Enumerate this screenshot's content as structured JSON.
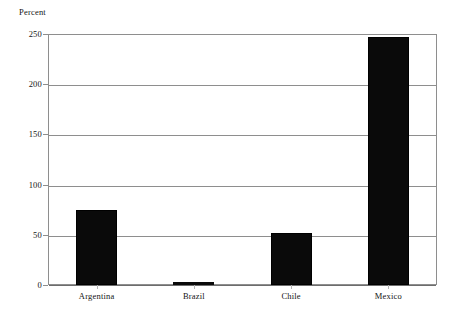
{
  "chart_data": {
    "type": "bar",
    "title": "",
    "subtitle": "",
    "xlabel": "",
    "ylabel": "Percent",
    "categories": [
      "Argentina",
      "Brazil",
      "Chile",
      "Mexico"
    ],
    "values": [
      75,
      2,
      52,
      247
    ],
    "ylim": [
      0,
      250
    ],
    "yticks": [
      0,
      50,
      100,
      150,
      200,
      250
    ],
    "ytick_labels": [
      "0",
      "50",
      "100",
      "150",
      "200",
      "250"
    ],
    "grid": true,
    "grid_axis": "y",
    "legend": false,
    "legend_position": "none",
    "bar_color": "#0a0a0a",
    "frame_color": "#8e8e8e",
    "background_color": "#ffffff",
    "annotations": []
  },
  "axis": {
    "y_title": "Percent"
  }
}
